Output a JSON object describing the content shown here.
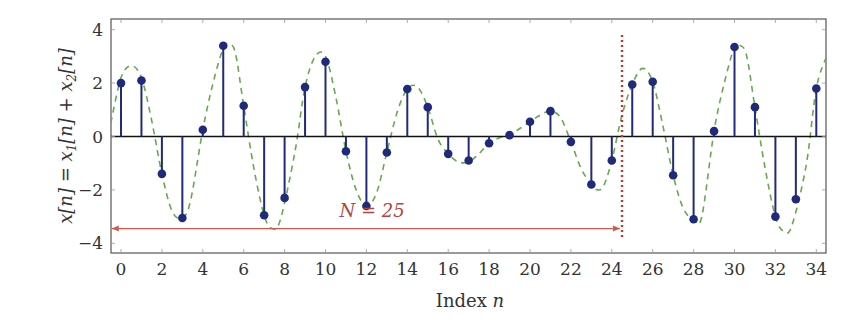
{
  "chart_data": {
    "type": "stem",
    "title": "",
    "xlabel": "Index n",
    "ylabel": "x[n] = x1[n] + x2[n]",
    "xlim": [
      -0.5,
      34.5
    ],
    "ylim": [
      -4.5,
      4.4
    ],
    "x_ticks": [
      0,
      2,
      4,
      6,
      8,
      10,
      12,
      14,
      16,
      18,
      20,
      22,
      24,
      26,
      28,
      30,
      32,
      34
    ],
    "y_ticks": [
      -4,
      -2,
      0,
      2,
      4
    ],
    "grid": false,
    "legend": null,
    "series": [
      {
        "name": "x[n] samples",
        "style": "stem",
        "color": "#1f2a7a",
        "x": [
          0,
          1,
          2,
          3,
          4,
          5,
          6,
          7,
          8,
          9,
          10,
          11,
          12,
          13,
          14,
          15,
          16,
          17,
          18,
          19,
          20,
          21,
          22,
          23,
          24,
          25,
          26,
          27,
          28,
          29,
          30,
          31,
          32,
          33,
          34
        ],
        "values": [
          2.0,
          2.1,
          -1.4,
          -3.05,
          0.25,
          3.4,
          1.15,
          -2.95,
          -2.3,
          1.85,
          2.8,
          -0.55,
          -2.6,
          -0.6,
          1.78,
          1.1,
          -0.65,
          -0.9,
          -0.25,
          0.05,
          0.55,
          0.95,
          -0.2,
          -1.8,
          -0.9,
          1.95,
          2.05,
          -1.45,
          -3.1,
          0.2,
          3.35,
          1.1,
          -3.0,
          -2.35,
          1.8
        ]
      },
      {
        "name": "continuous envelope",
        "style": "dashed",
        "color": "#6aa84f",
        "x": [
          -0.5,
          0,
          0.5,
          1,
          1.5,
          2,
          2.5,
          3,
          3.4,
          4,
          4.5,
          5,
          5.3,
          5.6,
          6,
          6.5,
          7,
          7.4,
          7.8,
          8.5,
          9,
          9.5,
          10,
          10.5,
          11,
          11.5,
          12,
          12.5,
          13,
          13.5,
          14,
          14.5,
          15,
          15.5,
          16,
          16.5,
          17,
          17.5,
          18,
          18.5,
          19,
          19.5,
          20,
          20.5,
          21,
          21.5,
          22,
          22.5,
          23,
          23.3,
          23.6,
          24,
          24.5,
          25,
          25.5,
          26,
          26.5,
          27,
          27.5,
          28,
          28.4,
          29,
          29.5,
          30,
          30.3,
          30.6,
          31,
          31.5,
          32,
          32.4,
          32.8,
          33.5,
          34,
          34.5
        ],
        "values": [
          0.5,
          2.2,
          2.65,
          2.2,
          0.6,
          -1.4,
          -2.8,
          -3.05,
          -2.4,
          0.25,
          2.0,
          3.3,
          3.45,
          3.1,
          1.15,
          -1.2,
          -2.95,
          -3.45,
          -3.1,
          -0.6,
          1.85,
          3.0,
          3.0,
          1.5,
          -0.55,
          -2.0,
          -2.6,
          -2.1,
          -0.6,
          0.9,
          1.78,
          1.85,
          1.1,
          -0.1,
          -0.65,
          -0.95,
          -0.95,
          -0.65,
          -0.25,
          -0.05,
          0.05,
          0.3,
          0.55,
          0.8,
          0.95,
          0.7,
          -0.2,
          -1.2,
          -1.8,
          -2.0,
          -1.85,
          -0.9,
          0.8,
          1.95,
          2.55,
          2.05,
          0.4,
          -1.45,
          -2.7,
          -3.1,
          -3.0,
          0.2,
          2.0,
          3.35,
          3.4,
          3.0,
          1.1,
          -1.2,
          -3.0,
          -3.55,
          -3.35,
          -1.1,
          1.8,
          3.0
        ]
      }
    ],
    "annotations": [
      {
        "type": "vertical-dotted-line",
        "x": 24.5,
        "y_from": 3.8,
        "y_to": -3.85,
        "color": "#c0392b"
      },
      {
        "type": "double-arrow",
        "x_from": -0.5,
        "x_to": 24.5,
        "y": -3.45,
        "color": "#d05a4e"
      },
      {
        "type": "text",
        "text": "N = 25",
        "x": 12.2,
        "y": -2.8,
        "color": "#b3453c"
      }
    ]
  },
  "labels": {
    "xlabel_text": "Index ",
    "xlabel_var": "n",
    "ylabel_parts": [
      "x[n] = x",
      "1",
      "[n] + x",
      "2",
      "[n]"
    ],
    "n_annotation": "N = 25"
  }
}
